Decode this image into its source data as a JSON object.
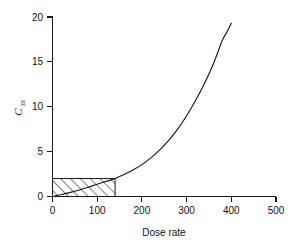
{
  "chart_data": {
    "type": "line",
    "title": "",
    "xlabel": "Dose rate",
    "ylabel": "Css",
    "ylabel_base": "C",
    "ylabel_subscript": "ss",
    "xlim": [
      0,
      500
    ],
    "ylim": [
      0,
      20
    ],
    "xticks": [
      0,
      100,
      200,
      300,
      400,
      500
    ],
    "xtick_labels": [
      "0",
      "100",
      "200",
      "300",
      "400",
      "500"
    ],
    "yticks": [
      0,
      5,
      10,
      15,
      20
    ],
    "ytick_labels": [
      "0",
      "5",
      "10",
      "15",
      "20"
    ],
    "grid": false,
    "legend": null,
    "series": [
      {
        "name": "Css vs dose rate",
        "color": "#1a1a1a",
        "x": [
          0,
          20,
          40,
          60,
          80,
          100,
          120,
          140,
          160,
          180,
          200,
          220,
          240,
          260,
          280,
          300,
          320,
          340,
          360,
          380,
          390,
          400
        ],
        "y": [
          0.0,
          0.22,
          0.46,
          0.73,
          1.03,
          1.37,
          1.68,
          2.0,
          2.45,
          2.95,
          3.55,
          4.3,
          5.2,
          6.25,
          7.5,
          9.0,
          10.7,
          12.6,
          14.8,
          17.4,
          18.3,
          19.3
        ]
      }
    ],
    "annotations": [
      {
        "name": "therapeutic-window",
        "type": "hatched-rectangle",
        "x0": 0,
        "x1": 140,
        "y0": 0,
        "y1": 2,
        "hatch": "forward-diagonal",
        "edge_color": "#1a1a1a",
        "fill": "none"
      }
    ]
  }
}
